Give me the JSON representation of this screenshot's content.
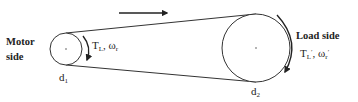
{
  "diagram": {
    "type": "belt-drive",
    "direction_arrow": "right",
    "colors": {
      "stroke": "#333333",
      "text": "#222222",
      "background": "#ffffff"
    },
    "motor": {
      "label_line1": "Motor",
      "label_line2": "side",
      "diameter_label": "d",
      "diameter_sub": "1",
      "torque_symbol": "T",
      "torque_sub": "L",
      "separator": ", ",
      "speed_symbol": "ω",
      "speed_sub": "r"
    },
    "load": {
      "label": "Load side",
      "diameter_label": "d",
      "diameter_sub": "2",
      "torque_symbol": "T",
      "torque_sub": "L",
      "torque_prime": "′",
      "separator": ", ",
      "speed_symbol": "ω",
      "speed_sub": "r",
      "speed_prime": "′"
    }
  }
}
